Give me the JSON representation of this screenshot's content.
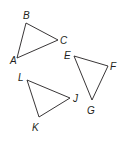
{
  "diagram": {
    "type": "geometry-triangles",
    "stroke_color": "#231f20",
    "triangles": [
      {
        "name": "ABC",
        "vertices": [
          {
            "label": "A",
            "x": 17,
            "y": 58,
            "lx": 10,
            "ly": 64
          },
          {
            "label": "B",
            "x": 26,
            "y": 23,
            "lx": 23,
            "ly": 19
          },
          {
            "label": "C",
            "x": 58,
            "y": 40,
            "lx": 60,
            "ly": 44
          }
        ]
      },
      {
        "name": "EFG",
        "vertices": [
          {
            "label": "E",
            "x": 74,
            "y": 56,
            "lx": 64,
            "ly": 59
          },
          {
            "label": "F",
            "x": 108,
            "y": 66,
            "lx": 110,
            "ly": 70
          },
          {
            "label": "G",
            "x": 92,
            "y": 100,
            "lx": 87,
            "ly": 114
          }
        ]
      },
      {
        "name": "JKL",
        "vertices": [
          {
            "label": "L",
            "x": 27,
            "y": 80,
            "lx": 18,
            "ly": 81
          },
          {
            "label": "J",
            "x": 70,
            "y": 98,
            "lx": 73,
            "ly": 102
          },
          {
            "label": "K",
            "x": 39,
            "y": 117,
            "lx": 32,
            "ly": 131
          }
        ]
      }
    ]
  }
}
